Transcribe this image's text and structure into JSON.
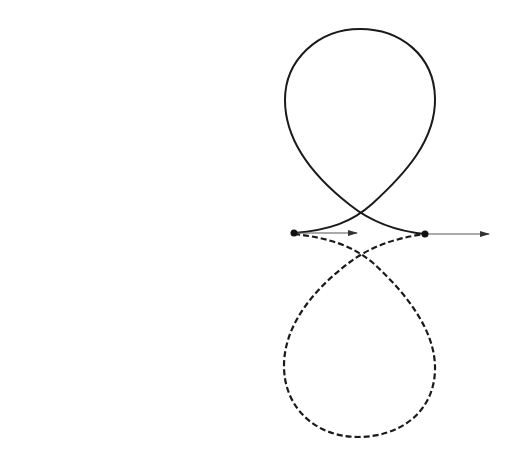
{
  "diagram": {
    "colors": {
      "background": "#ffffff",
      "curve": "#1a1a1a",
      "vector": "#555555",
      "point": "#111111"
    },
    "points": [
      {
        "id": "left-point",
        "x": 294,
        "y": 233
      },
      {
        "id": "right-point",
        "x": 425,
        "y": 234
      }
    ],
    "vectors": [
      {
        "id": "short-arrow",
        "from": [
          294,
          233
        ],
        "to": [
          357,
          233
        ]
      },
      {
        "id": "long-arrow",
        "from": [
          425,
          234
        ],
        "to": [
          489,
          234
        ]
      }
    ],
    "curves": [
      {
        "id": "upper-loop",
        "style": "solid",
        "top_y": 29,
        "x_range": [
          285,
          435
        ]
      },
      {
        "id": "lower-loop",
        "style": "dashed",
        "bottom_y": 437,
        "x_range": [
          284,
          435
        ]
      }
    ],
    "labels": []
  }
}
